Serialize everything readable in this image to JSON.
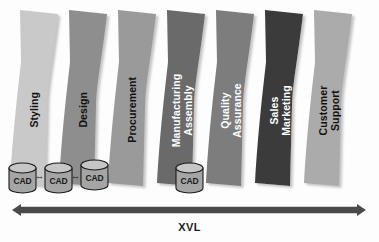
{
  "diagram": {
    "background_color": "#fdfdfd",
    "bands": [
      {
        "id": "styling",
        "label_lines": [
          "Styling"
        ],
        "fill": "#c9c9c9",
        "text_color": "#111111",
        "x": 14
      },
      {
        "id": "design",
        "label_lines": [
          "Design"
        ],
        "fill": "#8e8e8e",
        "text_color": "#111111",
        "x": 63
      },
      {
        "id": "procurement",
        "label_lines": [
          "Procurement"
        ],
        "fill": "#9a9a9a",
        "text_color": "#111111",
        "x": 112
      },
      {
        "id": "manufacturing-assembly",
        "label_lines": [
          "Manufacturing",
          "Assembly"
        ],
        "fill": "#6b6b6b",
        "text_color": "#ffffff",
        "x": 161
      },
      {
        "id": "quality-assurance",
        "label_lines": [
          "Quality",
          "Assurance"
        ],
        "fill": "#7d7d7d",
        "text_color": "#ffffff",
        "x": 210
      },
      {
        "id": "sales-marketing",
        "label_lines": [
          "Sales",
          "Marketing"
        ],
        "fill": "#3a3a3a",
        "text_color": "#ffffff",
        "x": 259
      },
      {
        "id": "customer-support",
        "label_lines": [
          "Customer",
          "Support"
        ],
        "fill": "#ababab",
        "text_color": "#111111",
        "x": 308
      }
    ],
    "cad_nodes": [
      {
        "id": "cad-1",
        "label": "CAD",
        "x": 9,
        "y": 163
      },
      {
        "id": "cad-2",
        "label": "CAD",
        "x": 45,
        "y": 163
      },
      {
        "id": "cad-3",
        "label": "CAD",
        "x": 81,
        "y": 160
      },
      {
        "id": "cad-4",
        "label": "CAD",
        "x": 176,
        "y": 163
      }
    ],
    "cad_links": [
      {
        "id": "cad-link-1",
        "glyph": "↔",
        "x": 36,
        "y": 176
      },
      {
        "id": "cad-link-2",
        "glyph": "↔",
        "x": 72,
        "y": 176
      }
    ],
    "cad_style": {
      "fill": "#a5a5a5",
      "top_fill": "#c6c6c6",
      "stroke": "#1a1a1a"
    },
    "span_arrow": {
      "id": "xvl-arrow",
      "label": "XVL",
      "color": "#4a4a4a",
      "label_color": "#1d1d1d",
      "y": 210,
      "label_y": 222
    }
  }
}
